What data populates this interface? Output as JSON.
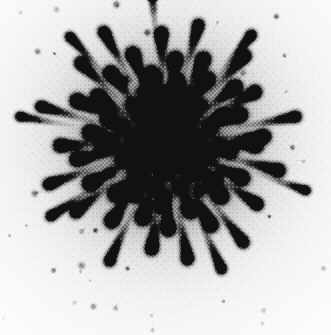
{
  "figure": {
    "title": "Radial burst pattern",
    "render_type": "halftone-grayscale-raster",
    "caption_visible": false
  },
  "canvas": {
    "width": 331,
    "height": 335,
    "background_color": "#ffffff",
    "ink_color": "#1c1c1c"
  },
  "pattern": {
    "center_x": 165,
    "center_y": 142,
    "core_radius": 52,
    "core_min_gray": "#3a3a3a",
    "halo_radius": 95,
    "max_ray_radius": 165,
    "ray_count": 56,
    "speck_count": 120,
    "core_blob_count": 46,
    "halftone_cell_px": 2,
    "halftone_strength": 0.42,
    "noise_seed": 20240617
  },
  "chart_data": {
    "type": "scatter",
    "title": "Radial burst pattern",
    "subtitle": "",
    "xlabel": "",
    "ylabel": "",
    "xlim": [
      0,
      331
    ],
    "ylim": [
      0,
      335
    ],
    "grid": false,
    "legend": null,
    "axes_visible": false,
    "tick_labels_x": [],
    "tick_labels_y": [],
    "annotations": [],
    "series": [
      {
        "name": "core-blobs",
        "marker": "circle",
        "color": "#2a2a2a",
        "note": "Dense overlapping dark blobs forming the mottled core.",
        "points": [
          {
            "x": 165,
            "y": 142,
            "r": 9,
            "g": 0.92
          },
          {
            "x": 150,
            "y": 128,
            "r": 8,
            "g": 0.9
          },
          {
            "x": 181,
            "y": 130,
            "r": 8,
            "g": 0.88
          },
          {
            "x": 146,
            "y": 156,
            "r": 8,
            "g": 0.9
          },
          {
            "x": 183,
            "y": 157,
            "r": 8,
            "g": 0.88
          },
          {
            "x": 165,
            "y": 115,
            "r": 7,
            "g": 0.86
          },
          {
            "x": 165,
            "y": 170,
            "r": 7,
            "g": 0.86
          },
          {
            "x": 134,
            "y": 141,
            "r": 7,
            "g": 0.86
          },
          {
            "x": 197,
            "y": 142,
            "r": 7,
            "g": 0.84
          },
          {
            "x": 140,
            "y": 112,
            "r": 7,
            "g": 0.84
          },
          {
            "x": 191,
            "y": 113,
            "r": 7,
            "g": 0.82
          },
          {
            "x": 137,
            "y": 172,
            "r": 7,
            "g": 0.84
          },
          {
            "x": 193,
            "y": 172,
            "r": 7,
            "g": 0.82
          },
          {
            "x": 157,
            "y": 100,
            "r": 6,
            "g": 0.8
          },
          {
            "x": 176,
            "y": 101,
            "r": 6,
            "g": 0.8
          },
          {
            "x": 121,
            "y": 126,
            "r": 6,
            "g": 0.78
          },
          {
            "x": 210,
            "y": 127,
            "r": 6,
            "g": 0.78
          },
          {
            "x": 122,
            "y": 159,
            "r": 6,
            "g": 0.78
          },
          {
            "x": 209,
            "y": 158,
            "r": 6,
            "g": 0.76
          },
          {
            "x": 152,
            "y": 186,
            "r": 6,
            "g": 0.78
          },
          {
            "x": 180,
            "y": 187,
            "r": 6,
            "g": 0.76
          },
          {
            "x": 151,
            "y": 143,
            "r": 6,
            "g": 0.9
          },
          {
            "x": 179,
            "y": 143,
            "r": 6,
            "g": 0.9
          },
          {
            "x": 165,
            "y": 129,
            "r": 6,
            "g": 0.92
          },
          {
            "x": 165,
            "y": 157,
            "r": 6,
            "g": 0.9
          },
          {
            "x": 131,
            "y": 104,
            "r": 5,
            "g": 0.74
          },
          {
            "x": 201,
            "y": 104,
            "r": 5,
            "g": 0.72
          },
          {
            "x": 113,
            "y": 144,
            "r": 5,
            "g": 0.72
          },
          {
            "x": 218,
            "y": 143,
            "r": 5,
            "g": 0.72
          },
          {
            "x": 132,
            "y": 190,
            "r": 5,
            "g": 0.72
          },
          {
            "x": 200,
            "y": 190,
            "r": 5,
            "g": 0.7
          },
          {
            "x": 165,
            "y": 196,
            "r": 5,
            "g": 0.72
          },
          {
            "x": 165,
            "y": 90,
            "r": 5,
            "g": 0.74
          },
          {
            "x": 142,
            "y": 92,
            "r": 5,
            "g": 0.7
          },
          {
            "x": 189,
            "y": 93,
            "r": 5,
            "g": 0.7
          },
          {
            "x": 110,
            "y": 116,
            "r": 4,
            "g": 0.64
          },
          {
            "x": 221,
            "y": 116,
            "r": 4,
            "g": 0.62
          },
          {
            "x": 110,
            "y": 172,
            "r": 4,
            "g": 0.64
          },
          {
            "x": 221,
            "y": 171,
            "r": 4,
            "g": 0.62
          },
          {
            "x": 145,
            "y": 205,
            "r": 4,
            "g": 0.62
          },
          {
            "x": 187,
            "y": 205,
            "r": 4,
            "g": 0.6
          },
          {
            "x": 156,
            "y": 79,
            "r": 4,
            "g": 0.62
          },
          {
            "x": 177,
            "y": 80,
            "r": 4,
            "g": 0.6
          },
          {
            "x": 124,
            "y": 80,
            "r": 4,
            "g": 0.56
          },
          {
            "x": 206,
            "y": 81,
            "r": 4,
            "g": 0.54
          },
          {
            "x": 165,
            "y": 210,
            "r": 4,
            "g": 0.58
          }
        ]
      },
      {
        "name": "comet-rays",
        "marker": "comet",
        "color": "#222222",
        "note": "Ray heads (dark round dots) with faint tails tapering back toward the center.",
        "points": [
          {
            "angle_deg": 2,
            "r": 92,
            "head_r": 5.0,
            "g": 0.86,
            "tail": 40
          },
          {
            "angle_deg": 14,
            "r": 118,
            "head_r": 4.6,
            "g": 0.82,
            "tail": 52
          },
          {
            "angle_deg": 25,
            "r": 86,
            "head_r": 5.2,
            "g": 0.88,
            "tail": 34
          },
          {
            "angle_deg": 34,
            "r": 112,
            "head_r": 4.4,
            "g": 0.8,
            "tail": 48
          },
          {
            "angle_deg": 44,
            "r": 78,
            "head_r": 5.4,
            "g": 0.9,
            "tail": 30
          },
          {
            "angle_deg": 52,
            "r": 128,
            "head_r": 4.2,
            "g": 0.76,
            "tail": 58
          },
          {
            "angle_deg": 61,
            "r": 95,
            "head_r": 5.0,
            "g": 0.86,
            "tail": 42
          },
          {
            "angle_deg": 70,
            "r": 74,
            "head_r": 5.2,
            "g": 0.88,
            "tail": 28
          },
          {
            "angle_deg": 79,
            "r": 120,
            "head_r": 4.4,
            "g": 0.78,
            "tail": 54
          },
          {
            "angle_deg": 88,
            "r": 88,
            "head_r": 5.0,
            "g": 0.86,
            "tail": 38
          },
          {
            "angle_deg": 97,
            "r": 108,
            "head_r": 4.6,
            "g": 0.8,
            "tail": 46
          },
          {
            "angle_deg": 106,
            "r": 80,
            "head_r": 5.2,
            "g": 0.88,
            "tail": 32
          },
          {
            "angle_deg": 115,
            "r": 132,
            "head_r": 4.0,
            "g": 0.74,
            "tail": 60
          },
          {
            "angle_deg": 124,
            "r": 96,
            "head_r": 5.0,
            "g": 0.86,
            "tail": 42
          },
          {
            "angle_deg": 133,
            "r": 72,
            "head_r": 5.4,
            "g": 0.9,
            "tail": 26
          },
          {
            "angle_deg": 142,
            "r": 114,
            "head_r": 4.4,
            "g": 0.8,
            "tail": 50
          },
          {
            "angle_deg": 151,
            "r": 86,
            "head_r": 5.2,
            "g": 0.88,
            "tail": 36
          },
          {
            "angle_deg": 160,
            "r": 124,
            "head_r": 4.2,
            "g": 0.76,
            "tail": 56
          },
          {
            "angle_deg": 169,
            "r": 90,
            "head_r": 5.0,
            "g": 0.86,
            "tail": 40
          },
          {
            "angle_deg": 178,
            "r": 106,
            "head_r": 4.6,
            "g": 0.82,
            "tail": 46
          },
          {
            "angle_deg": 187,
            "r": 76,
            "head_r": 5.2,
            "g": 0.88,
            "tail": 30
          },
          {
            "angle_deg": 196,
            "r": 130,
            "head_r": 4.0,
            "g": 0.74,
            "tail": 58
          },
          {
            "angle_deg": 205,
            "r": 98,
            "head_r": 5.0,
            "g": 0.86,
            "tail": 44
          },
          {
            "angle_deg": 214,
            "r": 82,
            "head_r": 5.2,
            "g": 0.88,
            "tail": 34
          },
          {
            "angle_deg": 223,
            "r": 116,
            "head_r": 4.4,
            "g": 0.8,
            "tail": 50
          },
          {
            "angle_deg": 232,
            "r": 88,
            "head_r": 5.0,
            "g": 0.86,
            "tail": 38
          },
          {
            "angle_deg": 241,
            "r": 126,
            "head_r": 4.2,
            "g": 0.76,
            "tail": 56
          },
          {
            "angle_deg": 250,
            "r": 94,
            "head_r": 5.0,
            "g": 0.86,
            "tail": 40
          },
          {
            "angle_deg": 259,
            "r": 70,
            "head_r": 5.4,
            "g": 0.9,
            "tail": 26
          },
          {
            "angle_deg": 268,
            "r": 110,
            "head_r": 4.6,
            "g": 0.82,
            "tail": 48
          },
          {
            "angle_deg": 277,
            "r": 84,
            "head_r": 5.2,
            "g": 0.88,
            "tail": 34
          },
          {
            "angle_deg": 286,
            "r": 122,
            "head_r": 4.2,
            "g": 0.78,
            "tail": 54
          },
          {
            "angle_deg": 295,
            "r": 92,
            "head_r": 5.0,
            "g": 0.86,
            "tail": 40
          },
          {
            "angle_deg": 304,
            "r": 76,
            "head_r": 5.2,
            "g": 0.88,
            "tail": 30
          },
          {
            "angle_deg": 313,
            "r": 118,
            "head_r": 4.4,
            "g": 0.8,
            "tail": 52
          },
          {
            "angle_deg": 322,
            "r": 90,
            "head_r": 5.0,
            "g": 0.86,
            "tail": 38
          },
          {
            "angle_deg": 331,
            "r": 104,
            "head_r": 4.6,
            "g": 0.82,
            "tail": 44
          },
          {
            "angle_deg": 340,
            "r": 80,
            "head_r": 5.2,
            "g": 0.88,
            "tail": 32
          },
          {
            "angle_deg": 349,
            "r": 134,
            "head_r": 4.0,
            "g": 0.72,
            "tail": 60
          },
          {
            "angle_deg": 357,
            "r": 100,
            "head_r": 4.8,
            "g": 0.84,
            "tail": 44
          },
          {
            "angle_deg": 8,
            "r": 66,
            "head_r": 5.0,
            "g": 0.88,
            "tail": 24
          },
          {
            "angle_deg": 38,
            "r": 64,
            "head_r": 5.0,
            "g": 0.88,
            "tail": 22
          },
          {
            "angle_deg": 66,
            "r": 140,
            "head_r": 3.8,
            "g": 0.7,
            "tail": 62
          },
          {
            "angle_deg": 93,
            "r": 64,
            "head_r": 5.0,
            "g": 0.88,
            "tail": 22
          },
          {
            "angle_deg": 120,
            "r": 62,
            "head_r": 5.0,
            "g": 0.88,
            "tail": 22
          },
          {
            "angle_deg": 147,
            "r": 136,
            "head_r": 3.8,
            "g": 0.7,
            "tail": 60
          },
          {
            "angle_deg": 174,
            "r": 64,
            "head_r": 5.0,
            "g": 0.88,
            "tail": 22
          },
          {
            "angle_deg": 201,
            "r": 62,
            "head_r": 5.0,
            "g": 0.88,
            "tail": 22
          },
          {
            "angle_deg": 228,
            "r": 142,
            "head_r": 3.6,
            "g": 0.68,
            "tail": 62
          },
          {
            "angle_deg": 255,
            "r": 64,
            "head_r": 5.0,
            "g": 0.88,
            "tail": 22
          },
          {
            "angle_deg": 282,
            "r": 62,
            "head_r": 5.0,
            "g": 0.88,
            "tail": 22
          },
          {
            "angle_deg": 309,
            "r": 138,
            "head_r": 3.8,
            "g": 0.7,
            "tail": 60
          },
          {
            "angle_deg": 336,
            "r": 64,
            "head_r": 5.0,
            "g": 0.88,
            "tail": 22
          },
          {
            "angle_deg": 19,
            "r": 150,
            "head_r": 3.4,
            "g": 0.64,
            "tail": 55
          },
          {
            "angle_deg": 190,
            "r": 148,
            "head_r": 3.4,
            "g": 0.64,
            "tail": 55
          },
          {
            "angle_deg": 265,
            "r": 152,
            "head_r": 3.2,
            "g": 0.62,
            "tail": 52
          }
        ]
      },
      {
        "name": "outer-specks",
        "marker": "dot",
        "color": "#555555",
        "note": "Sparse faint isolated specks scattered in the white margin."
      }
    ]
  }
}
